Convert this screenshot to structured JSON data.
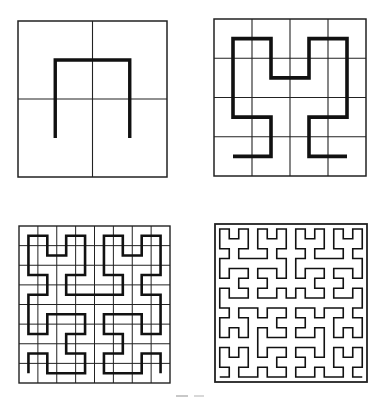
{
  "figure": {
    "line_color": "#111111",
    "grid_color": "#222222",
    "background": "#ffffff",
    "panels": [
      {
        "id": "order-1",
        "order": 1,
        "grid_divisions": 2,
        "show_grid": true,
        "box": {
          "x": 18,
          "y": 21,
          "w": 149,
          "h": 156
        },
        "curve_width": 3.4,
        "grid_width": 1.1
      },
      {
        "id": "order-2",
        "order": 2,
        "grid_divisions": 4,
        "show_grid": true,
        "box": {
          "x": 214,
          "y": 19,
          "w": 152,
          "h": 157
        },
        "curve_width": 3.6,
        "grid_width": 1.1
      },
      {
        "id": "order-3",
        "order": 3,
        "grid_divisions": 8,
        "show_grid": true,
        "box": {
          "x": 19,
          "y": 226,
          "w": 151,
          "h": 157
        },
        "curve_width": 2.6,
        "grid_width": 1.0
      },
      {
        "id": "order-4",
        "order": 4,
        "grid_divisions": 16,
        "show_grid": false,
        "box": {
          "x": 215,
          "y": 224,
          "w": 152,
          "h": 158
        },
        "curve_width": 1.6,
        "grid_width": 1.4
      }
    ]
  },
  "caption": {
    "text": ""
  }
}
